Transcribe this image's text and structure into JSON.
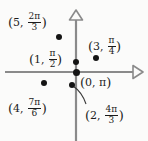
{
  "figure": {
    "background_color": "#fbfbfa",
    "axis_color": "#8a8a8a",
    "dot_color": "#141414",
    "text_color": "#1b1b1b"
  },
  "axes": {
    "horizontal": {
      "name": "polar-axis",
      "y": 72,
      "x_start": 5,
      "x_end": 143,
      "arrow": "right-open-triangle"
    },
    "vertical": {
      "name": "vertical-axis",
      "x": 76,
      "y_start": 10,
      "y_end": 141,
      "arrow": "up-open-triangle"
    },
    "origin": {
      "x": 76,
      "y": 72
    }
  },
  "points": [
    {
      "id": "p1",
      "label_text": "(5, 2π/3)",
      "r": "5",
      "theta_num": "2π",
      "theta_den": "3",
      "dot": {
        "x": 59,
        "y": 37
      },
      "label_pos": {
        "x": 8,
        "y": 8
      }
    },
    {
      "id": "p2",
      "label_text": "(3, π/4)",
      "r": "3",
      "theta_num": "π",
      "theta_den": "4",
      "dot": {
        "x": 96,
        "y": 58
      },
      "label_pos": {
        "x": 88,
        "y": 32
      }
    },
    {
      "id": "p3",
      "label_text": "(1, π/2)",
      "r": "1",
      "theta_num": "π",
      "theta_den": "2",
      "dot": {
        "x": 76,
        "y": 62
      },
      "label_pos": {
        "x": 29,
        "y": 45
      }
    },
    {
      "id": "p4",
      "label_text": "(0, π)",
      "r": "0",
      "theta_num": "π",
      "theta_den": "",
      "dot": {
        "x": 76,
        "y": 72
      },
      "label_pos": {
        "x": 80,
        "y": 75
      }
    },
    {
      "id": "p5",
      "label_text": "(4, 7π/6)",
      "r": "4",
      "theta_num": "7π",
      "theta_den": "6",
      "dot": {
        "x": 44,
        "y": 83
      },
      "label_pos": {
        "x": 8,
        "y": 94
      }
    },
    {
      "id": "p6",
      "label_text": "(2, 4π/3)",
      "r": "2",
      "theta_num": "4π",
      "theta_den": "3",
      "dot": {
        "x": 72,
        "y": 85
      },
      "label_pos": {
        "x": 85,
        "y": 101
      }
    }
  ],
  "leader_line": {
    "name": "leader-line-to-2-4pi-3",
    "from": {
      "x": 73,
      "y": 86
    },
    "to": {
      "x": 86,
      "y": 104
    }
  }
}
